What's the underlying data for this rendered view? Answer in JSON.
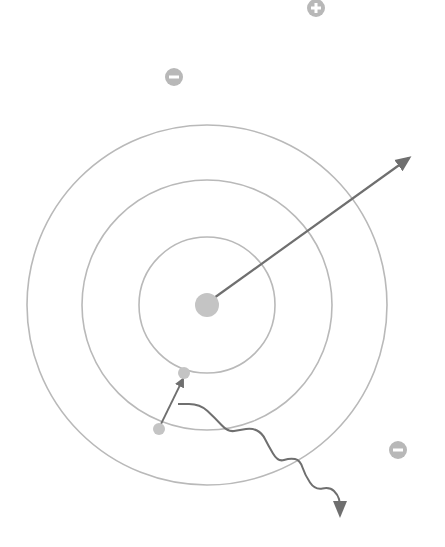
{
  "diagram": {
    "type": "atom-energy-levels",
    "colors": {
      "shell": "#b9b9b9",
      "particle": "#c4c4c4",
      "arrow": "#6f6f6f",
      "ion_bg": "#b8b8b8",
      "ion_fg": "#ffffff"
    },
    "nucleus": {
      "cx": 207,
      "cy": 305,
      "r": 12
    },
    "shells": [
      {
        "r": 68
      },
      {
        "r": 125
      },
      {
        "r": 180
      }
    ],
    "electrons": [
      {
        "name": "excited-electron",
        "cx": 184,
        "cy": 373,
        "r": 6
      },
      {
        "name": "ground-electron",
        "cx": 159,
        "cy": 429,
        "r": 6
      }
    ],
    "ions": [
      {
        "name": "positive-ion",
        "sign": "+",
        "cx": 316,
        "cy": 8,
        "r": 9
      },
      {
        "name": "negative-ion-top",
        "sign": "−",
        "cx": 174,
        "cy": 77,
        "r": 9
      },
      {
        "name": "negative-ion-right",
        "sign": "−",
        "cx": 398,
        "cy": 450,
        "r": 9
      }
    ],
    "arrows": {
      "ionization": {
        "x1": 214,
        "y1": 298,
        "x2": 409,
        "y2": 158
      },
      "excitation": {
        "x1": 161,
        "y1": 424,
        "x2": 183,
        "y2": 379
      },
      "photon": {
        "start_x": 178,
        "start_y": 404,
        "end_x": 340,
        "end_y": 515
      }
    }
  }
}
